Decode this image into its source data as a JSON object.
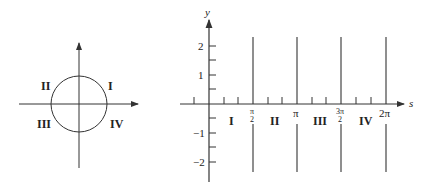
{
  "left_diagram": {
    "description": "Unit circle with axes and quadrant labels",
    "quadrants": [
      "I",
      "II",
      "III",
      "IV"
    ]
  },
  "right_diagram": {
    "axis_x_label": "s",
    "axis_y_label": "y",
    "y_ticks": [
      "2",
      "1",
      "−1",
      "−2"
    ],
    "x_ticks": {
      "pi_over_2_num": "π",
      "pi_over_2_den": "2",
      "pi": "π",
      "three_pi_over_2_num": "3π",
      "three_pi_over_2_den": "2",
      "two_pi": "2π"
    },
    "interval_labels": [
      "I",
      "II",
      "III",
      "IV"
    ]
  },
  "colors": {
    "stroke": "#333333",
    "text": "#222222"
  }
}
